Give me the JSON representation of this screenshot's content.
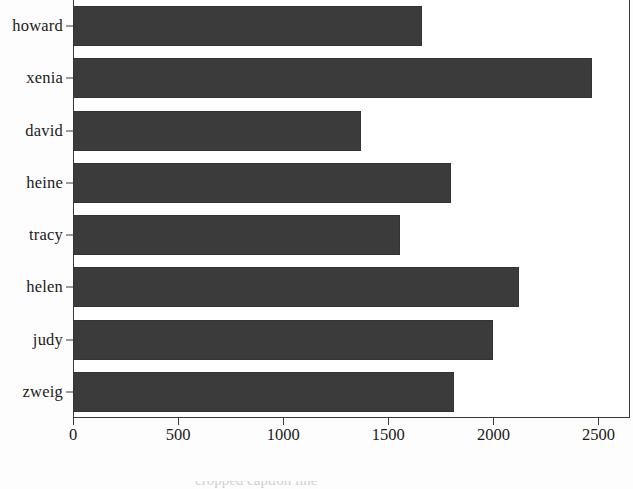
{
  "chart_data": {
    "type": "bar",
    "orientation": "horizontal",
    "title": "",
    "xlabel": "",
    "ylabel": "",
    "categories": [
      "howard",
      "xenia",
      "david",
      "heine",
      "tracy",
      "helen",
      "judy",
      "zweig"
    ],
    "values": [
      1660,
      2470,
      1370,
      1800,
      1555,
      2120,
      2000,
      1815
    ],
    "xlim": [
      0,
      2650
    ],
    "ylim": [
      0,
      8
    ],
    "xticks": [
      0,
      500,
      1000,
      1500,
      2000,
      2500
    ],
    "xtick_labels": [
      "0",
      "500",
      "1000",
      "1500",
      "2000",
      "2500"
    ],
    "ytick_labels": [
      "howard",
      "xenia",
      "david",
      "heine",
      "tracy",
      "helen",
      "judy",
      "zweig"
    ],
    "grid": false,
    "legend": null,
    "bar_color": "#3b3b3b",
    "axis_color": "#3a3a3a",
    "background_color": "#ffffff"
  },
  "caption": {
    "text": "cropped caption line"
  }
}
